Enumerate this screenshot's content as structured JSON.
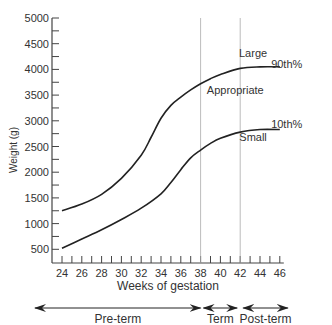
{
  "chart_data": {
    "type": "line",
    "title": "",
    "xlabel": "Weeks of gestation",
    "ylabel": "Weight (g)",
    "xlim": [
      23,
      47
    ],
    "ylim": [
      500,
      5000
    ],
    "x_ticks": [
      24,
      26,
      28,
      30,
      32,
      34,
      36,
      38,
      40,
      42,
      44,
      46
    ],
    "y_ticks": [
      500,
      1000,
      1500,
      2000,
      2500,
      3000,
      3500,
      4000,
      4500,
      5000
    ],
    "grid": false,
    "vertical_lines": [
      38,
      42
    ],
    "series": [
      {
        "name": "90th%",
        "x": [
          24,
          26,
          28,
          30,
          32,
          33,
          34,
          35,
          36,
          37,
          38,
          39,
          40,
          42,
          44,
          46
        ],
        "values": [
          1250,
          1380,
          1570,
          1880,
          2330,
          2680,
          3050,
          3300,
          3460,
          3600,
          3720,
          3820,
          3900,
          4020,
          4050,
          4050
        ]
      },
      {
        "name": "10th%",
        "x": [
          24,
          26,
          28,
          30,
          32,
          34,
          35,
          36,
          37,
          38,
          39,
          40,
          42,
          44,
          46
        ],
        "values": [
          520,
          700,
          880,
          1080,
          1300,
          1580,
          1800,
          2050,
          2280,
          2430,
          2560,
          2660,
          2780,
          2830,
          2830
        ]
      }
    ],
    "annotations": [
      {
        "text": "Large",
        "x": 43.3,
        "y": 4250
      },
      {
        "text": "90th%",
        "x": 46.7,
        "y": 4030
      },
      {
        "text": "Appropriate",
        "x": 41.5,
        "y": 3530
      },
      {
        "text": "10th%",
        "x": 46.7,
        "y": 2860
      },
      {
        "text": "Small",
        "x": 43.3,
        "y": 2600
      }
    ],
    "periods": [
      {
        "label": "Pre-term",
        "from": 24,
        "to": 38
      },
      {
        "label": "Term",
        "from": 38,
        "to": 42
      },
      {
        "label": "Post-term",
        "from": 42,
        "to": 46
      }
    ]
  }
}
